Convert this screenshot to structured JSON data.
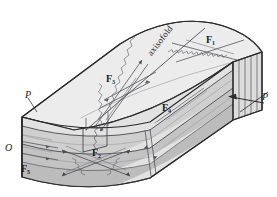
{
  "figure": {
    "kind": "geological-block-diagram",
    "width": 277,
    "height": 197
  },
  "colors": {
    "background": "#ffffff",
    "top_surface": "#ececed",
    "upper_layer": "#e2e2e3",
    "mid_layer": "#cfcfd0",
    "lower_layer": "#c3c3c4",
    "end_panel": "#dcdcdd",
    "outline": "#2b2b2b",
    "thin_line": "#6f6f72",
    "text": "#1a1a1a"
  },
  "labels": {
    "axis_of_fold": "axisofold",
    "fracture_1": "F",
    "fracture_1_sub": "1",
    "fracture_2": "F",
    "fracture_2_sub": "2",
    "fracture_3": "F",
    "fracture_3_sub": "3",
    "fracture_4": "F",
    "fracture_4_sub": "4",
    "fracture_5": "F",
    "fracture_5_sub": "5",
    "stress_left": "P",
    "stress_right": "P",
    "origin": "O"
  },
  "annotations": {
    "stress_arrow_direction": "left",
    "fold_type": "anticline",
    "label_list": [
      "axisofold",
      "F1",
      "F2",
      "F3",
      "F4",
      "F5",
      "P",
      "P",
      "O"
    ]
  }
}
